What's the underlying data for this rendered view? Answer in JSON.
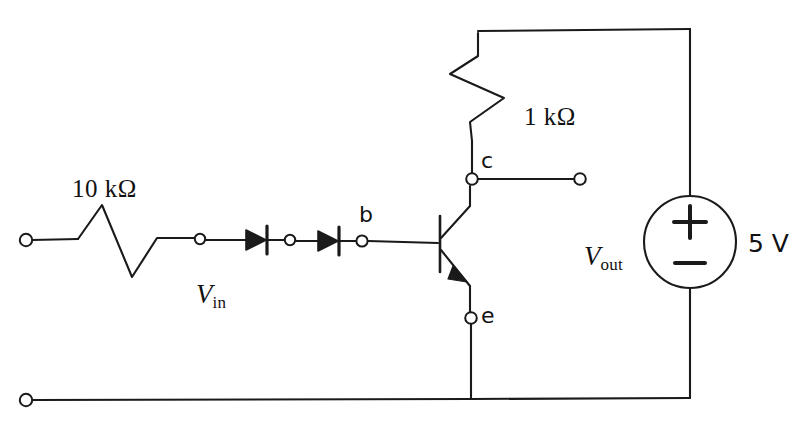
{
  "diagram": {
    "stroke_color": "#1a1a1a",
    "background_color": "#ffffff"
  },
  "labels": {
    "r_input": "10 kΩ",
    "r_collector": "1 kΩ",
    "v_in_symbol": "V",
    "v_in_sub": "in",
    "v_out_symbol": "V",
    "v_out_sub": "out",
    "source_value": "5 V",
    "source_plus": "+",
    "source_minus": "−",
    "node_base": "b",
    "node_collector": "c",
    "node_emitter": "e"
  },
  "components": [
    {
      "name": "input-resistor",
      "type": "resistor",
      "value": "10 kΩ",
      "orientation": "horizontal"
    },
    {
      "name": "diode-1",
      "type": "diode",
      "direction": "right"
    },
    {
      "name": "diode-2",
      "type": "diode",
      "direction": "right"
    },
    {
      "name": "transistor",
      "type": "bjt",
      "polarity": "pnp",
      "terminals": [
        "b",
        "c",
        "e"
      ]
    },
    {
      "name": "collector-resistor",
      "type": "resistor",
      "value": "1 kΩ",
      "orientation": "vertical"
    },
    {
      "name": "voltage-source",
      "type": "dc-source",
      "value": "5 V",
      "plus": "top",
      "minus": "bottom"
    }
  ],
  "terminals": [
    {
      "name": "input-terminal",
      "x": 26,
      "y": 240
    },
    {
      "name": "mid-resistor-node",
      "x": 200,
      "y": 240
    },
    {
      "name": "inter-diode-node",
      "x": 290,
      "y": 241
    },
    {
      "name": "base-node",
      "x": 362,
      "y": 241
    },
    {
      "name": "collector-node",
      "x": 472,
      "y": 179
    },
    {
      "name": "output-terminal",
      "x": 580,
      "y": 179
    },
    {
      "name": "emitter-node",
      "x": 471,
      "y": 318
    },
    {
      "name": "ground-terminal",
      "x": 26,
      "y": 400
    }
  ]
}
